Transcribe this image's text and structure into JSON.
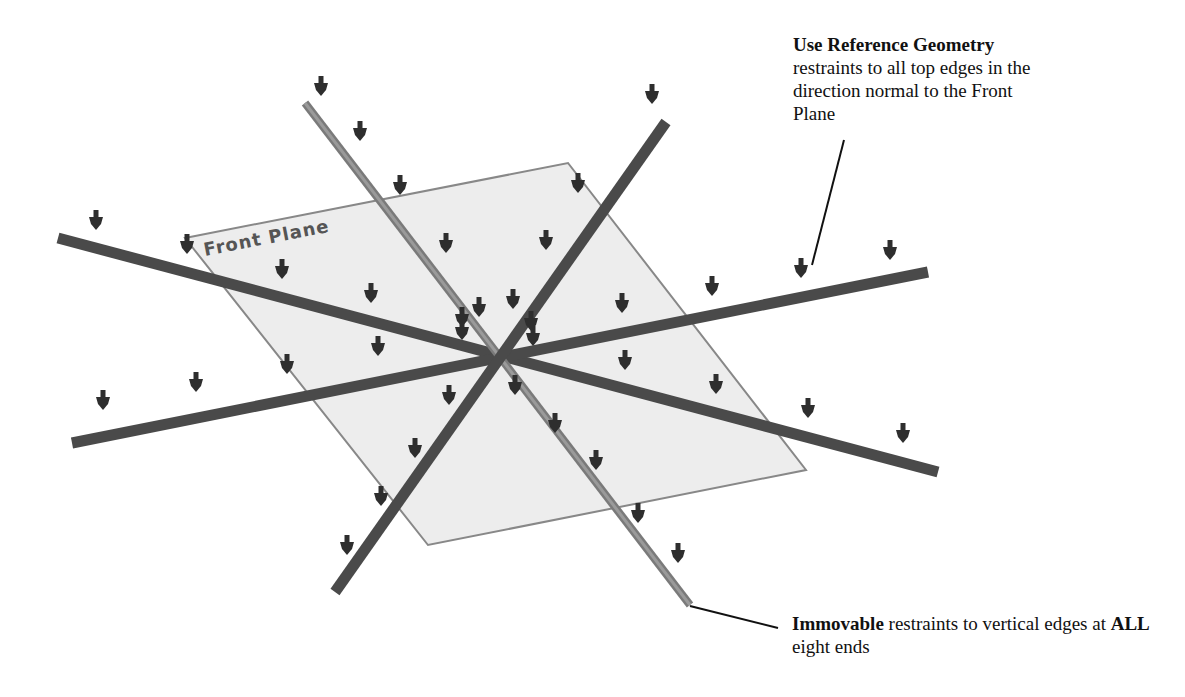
{
  "diagram": {
    "plane_label": "Front Plane",
    "colors": {
      "plane_fill": "#ededed",
      "plane_edge": "#888888",
      "beam_dark": "#4a4a4a",
      "beam_light": "#7a7a7a",
      "arrow": "#2e2e2e",
      "leader_line": "#111111"
    },
    "center": [
      493,
      357
    ],
    "plane_corners": [
      [
        185,
        238
      ],
      [
        568,
        163
      ],
      [
        806,
        470
      ],
      [
        428,
        545
      ]
    ],
    "beams": [
      {
        "name": "beam-left-upper-to-right-lower",
        "from": [
          58,
          238
        ],
        "to": [
          938,
          472
        ],
        "shade": "dark"
      },
      {
        "name": "beam-left-lower-to-right-upper",
        "from": [
          72,
          443
        ],
        "to": [
          928,
          272
        ],
        "shade": "dark"
      },
      {
        "name": "beam-top-left-to-bottom-right",
        "from": [
          305,
          103
        ],
        "to": [
          690,
          605
        ],
        "shade": "light"
      },
      {
        "name": "beam-top-right-to-bottom-left",
        "from": [
          666,
          122
        ],
        "to": [
          335,
          592
        ],
        "shade": "dark"
      }
    ],
    "arrows": [
      [
        96,
        230
      ],
      [
        187,
        254
      ],
      [
        282,
        279
      ],
      [
        371,
        303
      ],
      [
        462,
        327
      ],
      [
        903,
        443
      ],
      [
        808,
        418
      ],
      [
        716,
        394
      ],
      [
        625,
        370
      ],
      [
        533,
        346
      ],
      [
        103,
        410
      ],
      [
        196,
        392
      ],
      [
        287,
        374
      ],
      [
        378,
        356
      ],
      [
        462,
        340
      ],
      [
        890,
        260
      ],
      [
        801,
        278
      ],
      [
        712,
        296
      ],
      [
        622,
        313
      ],
      [
        531,
        331
      ],
      [
        321,
        96
      ],
      [
        360,
        141
      ],
      [
        400,
        195
      ],
      [
        446,
        253
      ],
      [
        479,
        317
      ],
      [
        515,
        395
      ],
      [
        555,
        433
      ],
      [
        596,
        470
      ],
      [
        638,
        523
      ],
      [
        678,
        563
      ],
      [
        652,
        104
      ],
      [
        578,
        193
      ],
      [
        546,
        250
      ],
      [
        513,
        309
      ],
      [
        449,
        405
      ],
      [
        415,
        458
      ],
      [
        381,
        506
      ],
      [
        347,
        555
      ]
    ]
  },
  "annotations": {
    "top": {
      "bold": "Use Reference Geometry",
      "text": "restraints to all top edges in the direction normal to the Front Plane",
      "leader": {
        "from": [
          844,
          140
        ],
        "to": [
          812,
          265
        ]
      }
    },
    "bottom": {
      "bold1": "Immovable",
      "text1": " restraints to vertical edges at ",
      "bold2": "ALL",
      "text2": " eight ends",
      "leader": {
        "from": [
          690,
          606
        ],
        "to": [
          778,
          628
        ]
      }
    }
  }
}
